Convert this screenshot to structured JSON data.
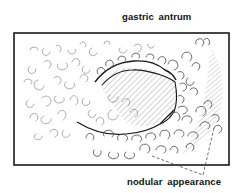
{
  "figure": {
    "type": "medical line illustration",
    "labels": {
      "top": "gastric antrum",
      "bottom": "nodular appearance"
    },
    "colors": {
      "line": "#1a1a1a",
      "hatch": "#555555",
      "nodule": "#8a8a8a",
      "background": "#ffffff"
    }
  }
}
